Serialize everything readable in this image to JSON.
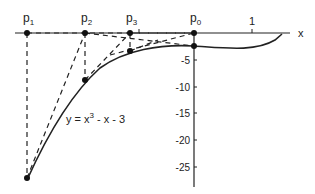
{
  "diagram": {
    "equation_label": "y = x",
    "equation_exp": "3",
    "equation_rest": " - x - 3",
    "axis_x_label": "x",
    "x_tick_label": "1",
    "points": [
      {
        "name": "p",
        "sub": "1"
      },
      {
        "name": "p",
        "sub": "2"
      },
      {
        "name": "p",
        "sub": "3"
      },
      {
        "name": "p",
        "sub": "0"
      }
    ],
    "y_ticks": [
      "-5",
      "-10",
      "-15",
      "-20",
      "-25"
    ],
    "colors": {
      "ink": "#222222",
      "background": "#ffffff"
    }
  }
}
